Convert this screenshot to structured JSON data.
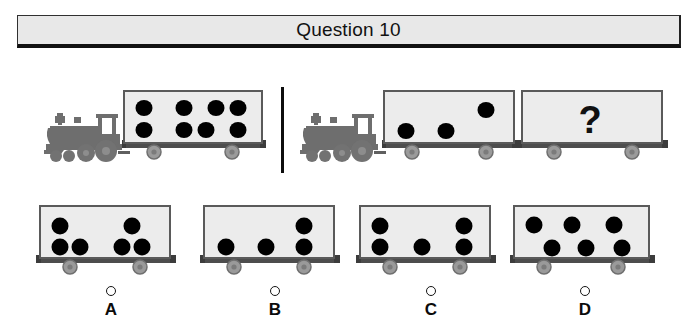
{
  "header": {
    "title": "Question 10",
    "background_color": "#e8e8e8",
    "border_color": "#111111"
  },
  "colors": {
    "dot": "#000000",
    "car_body": "#ececec",
    "car_border": "#555555",
    "car_frame": "#4d4d4d",
    "wheel": "#9a9a9a",
    "wheel_hub": "#6f6f6f",
    "locomotive": "#6e6e6e",
    "locomotive_dark": "#5a5a5a",
    "divider": "#0d0d0d",
    "question_mark": "#111111"
  },
  "puzzle": {
    "type": "analogy-dot-count",
    "question_mark_label": "?",
    "examples": [
      {
        "name": "example-train-left",
        "locomotive": true,
        "cars": [
          {
            "name": "example-car-1",
            "dot_count": 7,
            "dots": [
              {
                "x": 18,
                "y": 20
              },
              {
                "x": 52,
                "y": 20
              },
              {
                "x": 78,
                "y": 20
              },
              {
                "x": 97,
                "y": 20
              },
              {
                "x": 18,
                "y": 45
              },
              {
                "x": 52,
                "y": 45
              },
              {
                "x": 70,
                "y": 45
              },
              {
                "x": 97,
                "y": 45
              }
            ]
          }
        ]
      },
      {
        "name": "example-train-right",
        "locomotive": true,
        "cars": [
          {
            "name": "example-car-2",
            "dot_count": 3,
            "dots": [
              {
                "x": 20,
                "y": 46
              },
              {
                "x": 56,
                "y": 46
              },
              {
                "x": 92,
                "y": 24
              }
            ]
          },
          {
            "name": "answer-slot-car",
            "dot_count": 0,
            "is_question": true
          }
        ]
      }
    ]
  },
  "answers": [
    {
      "id": "A",
      "letter": "A",
      "dot_count": 5,
      "selected": false,
      "dots": [
        {
          "x": 20,
          "y": 22
        },
        {
          "x": 20,
          "y": 45
        },
        {
          "x": 40,
          "y": 45
        },
        {
          "x": 92,
          "y": 22
        },
        {
          "x": 82,
          "y": 45
        },
        {
          "x": 102,
          "y": 45
        }
      ]
    },
    {
      "id": "B",
      "letter": "B",
      "dot_count": 4,
      "selected": false,
      "dots": [
        {
          "x": 22,
          "y": 45
        },
        {
          "x": 60,
          "y": 45
        },
        {
          "x": 95,
          "y": 22
        },
        {
          "x": 95,
          "y": 45
        }
      ]
    },
    {
      "id": "C",
      "letter": "C",
      "dot_count": 5,
      "selected": false,
      "dots": [
        {
          "x": 20,
          "y": 22
        },
        {
          "x": 20,
          "y": 45
        },
        {
          "x": 60,
          "y": 45
        },
        {
          "x": 99,
          "y": 22
        },
        {
          "x": 99,
          "y": 45
        }
      ]
    },
    {
      "id": "D",
      "letter": "D",
      "dot_count": 6,
      "selected": false,
      "dots": [
        {
          "x": 20,
          "y": 22
        },
        {
          "x": 56,
          "y": 22
        },
        {
          "x": 95,
          "y": 22
        },
        {
          "x": 38,
          "y": 46
        },
        {
          "x": 70,
          "y": 46
        },
        {
          "x": 102,
          "y": 46
        }
      ]
    }
  ]
}
